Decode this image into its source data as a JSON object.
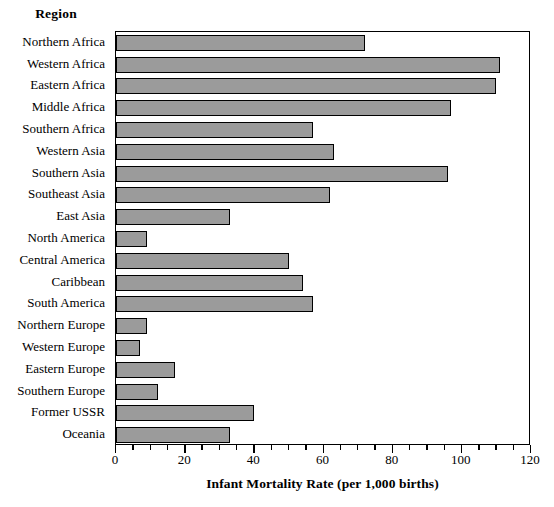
{
  "chart_data": {
    "type": "bar",
    "orientation": "horizontal",
    "title": "",
    "xlabel": "Infant Mortality Rate (per 1,000 births)",
    "ylabel": "Region",
    "xlim": [
      0,
      120
    ],
    "xticks": [
      0,
      20,
      40,
      60,
      80,
      100,
      120
    ],
    "xtick_labels": [
      "0",
      "20",
      "40",
      "60",
      "80",
      "100",
      "120"
    ],
    "minor_tick_step": 5,
    "grid": false,
    "legend": null,
    "bar_color": "#9b9b9b",
    "bar_edge_color": "#000000",
    "frame_color": "#000000",
    "background": "#ffffff",
    "categories": [
      "Northern Africa",
      "Western Africa",
      "Eastern Africa",
      "Middle Africa",
      "Southern Africa",
      "Western Asia",
      "Southern Asia",
      "Southeast Asia",
      "East Asia",
      "North America",
      "Central America",
      "Caribbean",
      "South America",
      "Northern Europe",
      "Western Europe",
      "Eastern Europe",
      "Southern Europe",
      "Former USSR",
      "Oceania"
    ],
    "values": [
      72,
      111,
      110,
      97,
      57,
      63,
      96,
      62,
      33,
      9,
      50,
      54,
      57,
      9,
      7,
      17,
      12,
      40,
      33
    ]
  },
  "axis": {
    "y_title": "Region",
    "x_title": "Infant Mortality Rate (per 1,000 births)"
  }
}
